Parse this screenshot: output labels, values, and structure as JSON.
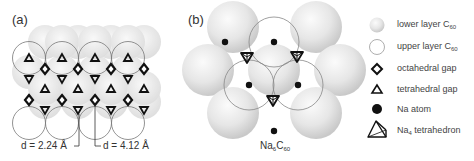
{
  "panel_a": {
    "label": "(a)",
    "distance_labels": [
      {
        "text": "d = 2.24 Å"
      },
      {
        "text": "d = 4.12 Å"
      }
    ]
  },
  "panel_b": {
    "label": "(b)",
    "formula_main": "Na",
    "formula_sub1": "6",
    "formula_c": "C",
    "formula_sub2": "60"
  },
  "legend": {
    "items": [
      {
        "icon": "lower-layer-sphere-icon",
        "text": "lower layer C",
        "sub": "60"
      },
      {
        "icon": "upper-layer-circle-icon",
        "text": "upper layer C",
        "sub": "60"
      },
      {
        "icon": "diamond-icon",
        "text": "octahedral gap",
        "sub": ""
      },
      {
        "icon": "triangle-icon",
        "text": "tetrahedral gap",
        "sub": ""
      },
      {
        "icon": "filled-circle-icon",
        "text": "Na atom",
        "sub": ""
      },
      {
        "icon": "tetrahedron-icon",
        "text": "Na",
        "sub": "4",
        "suffix": " tetrahedron"
      }
    ]
  },
  "colors": {
    "sphere_light": "#f4f4f4",
    "sphere_dark": "#cfcfcf",
    "outline": "#777777",
    "marker": "#111111"
  }
}
